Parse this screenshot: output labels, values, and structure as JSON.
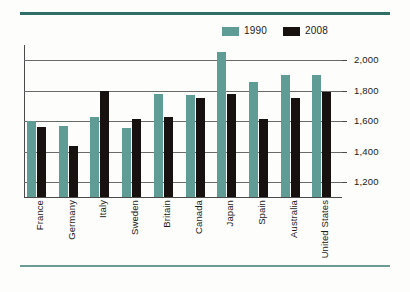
{
  "legend": {
    "items": [
      {
        "label": "1990",
        "color": "#5f9c96",
        "name": "legend-1990"
      },
      {
        "label": "2008",
        "color": "#17120f",
        "name": "legend-2008"
      }
    ]
  },
  "chart_data": {
    "type": "bar",
    "title": "",
    "xlabel": "",
    "ylabel": "",
    "ylim": [
      1105,
      2100
    ],
    "grid": true,
    "legend_position": "top-right",
    "yticks": [
      "1,200",
      "1,400",
      "1,600",
      "1,800",
      "2,000"
    ],
    "ytick_values": [
      1200,
      1400,
      1600,
      1800,
      2000
    ],
    "categories": [
      "France",
      "Germany",
      "Italy",
      "Sweden",
      "Britain",
      "Canada",
      "Japan",
      "Spain",
      "Australia",
      "United States"
    ],
    "series": [
      {
        "name": "1990",
        "color": "#5f9c96",
        "values": [
          1605,
          1570,
          1630,
          1555,
          1780,
          1775,
          2055,
          1860,
          1905,
          1905
        ]
      },
      {
        "name": "2008",
        "color": "#17120f",
        "values": [
          1565,
          1440,
          1800,
          1615,
          1630,
          1750,
          1780,
          1615,
          1755,
          1795
        ]
      }
    ]
  }
}
